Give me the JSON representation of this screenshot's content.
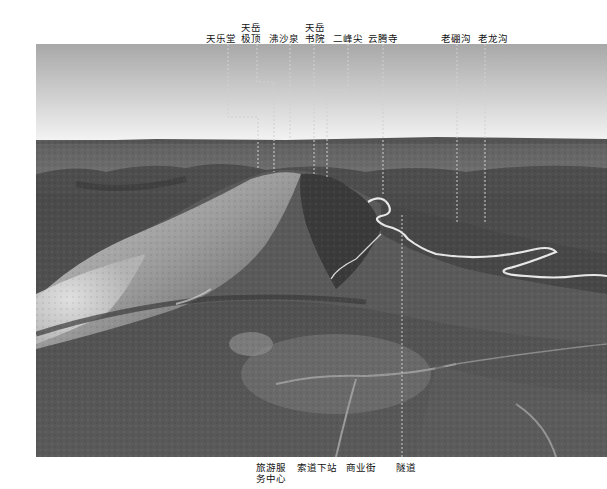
{
  "figure": {
    "colors": {
      "sky_top": "#a9a9a9",
      "sky_horizon": "#f4f4f4",
      "terrain_dark": "#3f3f3f",
      "terrain_mid": "#6b6b6b",
      "road": "#e8e8e8",
      "leader_line": "#d0d0d0",
      "label_text": "#111111"
    }
  },
  "top_labels": [
    {
      "id": "tianletang",
      "line1": "天乐堂",
      "line2": ""
    },
    {
      "id": "tianyue-jiding",
      "line1": "天岳",
      "line2": "极顶"
    },
    {
      "id": "feishaquan",
      "line1": "沸沙泉",
      "line2": ""
    },
    {
      "id": "tianyue-shuyuan",
      "line1": "天岳",
      "line2": "书院"
    },
    {
      "id": "erfengjian",
      "line1": "二峰尖",
      "line2": ""
    },
    {
      "id": "yunteng-si",
      "line1": "云腾寺",
      "line2": ""
    },
    {
      "id": "laopenggou",
      "line1": "老硼沟",
      "line2": ""
    },
    {
      "id": "laolonggou",
      "line1": "老龙沟",
      "line2": ""
    }
  ],
  "bottom_labels": [
    {
      "id": "visitor-center",
      "line1": "旅游服",
      "line2": "务中心"
    },
    {
      "id": "cableway-lower-station",
      "line1": "索道下站",
      "line2": ""
    },
    {
      "id": "commercial-street",
      "line1": "商业街",
      "line2": ""
    },
    {
      "id": "tunnel",
      "line1": "隧道",
      "line2": ""
    }
  ]
}
